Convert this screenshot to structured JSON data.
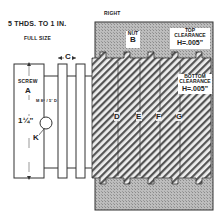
{
  "diagram": {
    "scale_line1": "5 THDS. TO 1 IN.",
    "scale_line2": "FULL SIZE",
    "view_label": "RIGHT",
    "dimension_c": "C",
    "screw_label": "SCREW",
    "screw_letter": "A",
    "diameter_label": "1¼\"",
    "angle_label": "M 8° / 5' D",
    "pin_label": "K",
    "nut_label": "NUT",
    "nut_letter": "B",
    "top_clearance": {
      "title": "TOP",
      "subtitle": "CLEARANCE",
      "value": "H=.005\""
    },
    "bottom_clearance": {
      "title": "BOTTOM",
      "subtitle": "CLEARANCE",
      "value": "H=.005\""
    },
    "thread_letters": [
      "D",
      "E",
      "F",
      "G"
    ],
    "colors": {
      "nut_fill": "#b8b8b8",
      "hatch": "#555555",
      "outline": "#333333"
    }
  }
}
